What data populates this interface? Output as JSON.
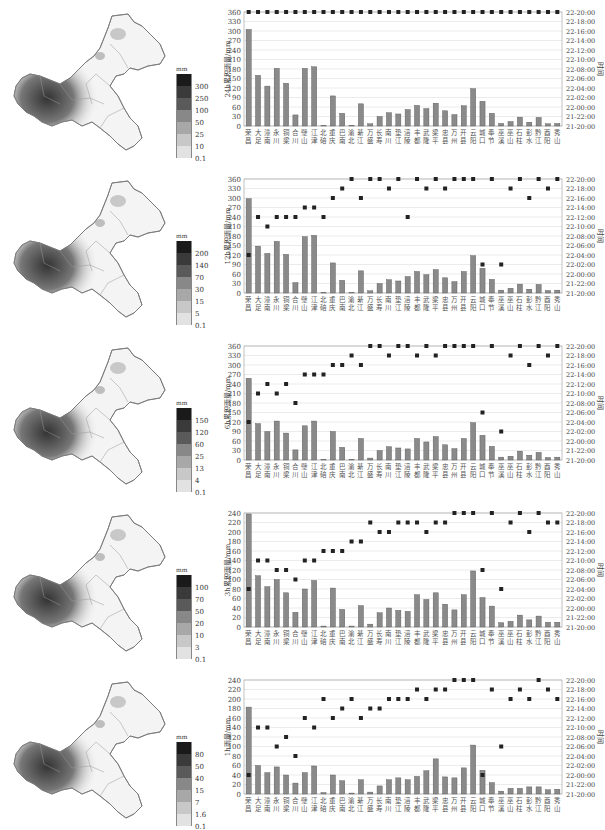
{
  "stations": [
    "荣昌",
    "大足",
    "潼南",
    "永川",
    "铜梁",
    "合川",
    "璧山",
    "江津",
    "北碚",
    "重庆",
    "巴南",
    "渝北",
    "綦江",
    "万盛",
    "长寿",
    "南川",
    "垫江",
    "涪陵",
    "丰都",
    "武隆",
    "梁平",
    "忠县",
    "万州",
    "开县",
    "云阳",
    "城口",
    "奉节",
    "巫溪",
    "巫山",
    "石柱",
    "彭水",
    "黔江",
    "酉阳",
    "秀山"
  ],
  "right_axis": {
    "label": "时间",
    "ticks": [
      "21-20:00",
      "21-22:00",
      "22-00:00",
      "22-02:00",
      "22-04:00",
      "22-06:00",
      "22-08:00",
      "22-10:00",
      "22-12:00",
      "22-14:00",
      "22-16:00",
      "22-18:00",
      "22-20:00"
    ]
  },
  "chart_data": [
    {
      "type": "bar",
      "title": "24h",
      "ylabel": "24h累积雨量/mm",
      "ylim": [
        0,
        360
      ],
      "yticks": [
        0,
        30,
        60,
        90,
        120,
        150,
        180,
        210,
        240,
        270,
        300,
        330,
        360
      ],
      "legend": {
        "unit": "mm",
        "labels": [
          "300",
          "250",
          "100",
          "50",
          "25",
          "10",
          "0.1"
        ]
      },
      "values": [
        305,
        160,
        126,
        182,
        135,
        35,
        182,
        187,
        2,
        95,
        40,
        2,
        70,
        7,
        30,
        42,
        38,
        52,
        65,
        55,
        72,
        48,
        36,
        64,
        118,
        78,
        40,
        8,
        14,
        28,
        12,
        27,
        7,
        8
      ],
      "time_index": [
        12,
        12,
        12,
        12,
        12,
        12,
        12,
        12,
        12,
        12,
        12,
        12,
        12,
        12,
        12,
        12,
        12,
        12,
        12,
        12,
        12,
        12,
        12,
        12,
        12,
        12,
        12,
        12,
        12,
        12,
        12,
        12,
        12,
        12
      ]
    },
    {
      "type": "bar",
      "title": "12h",
      "ylabel": "12h累积雨量/mm",
      "ylim": [
        0,
        360
      ],
      "yticks": [
        0,
        30,
        60,
        90,
        120,
        150,
        180,
        210,
        240,
        270,
        300,
        330,
        360
      ],
      "legend": {
        "unit": "mm",
        "labels": [
          "200",
          "140",
          "70",
          "30",
          "15",
          "5",
          "0.1"
        ]
      },
      "values": [
        298,
        148,
        125,
        163,
        122,
        33,
        178,
        182,
        2,
        95,
        40,
        2,
        70,
        7,
        30,
        42,
        38,
        52,
        68,
        58,
        74,
        48,
        36,
        68,
        118,
        78,
        43,
        9,
        15,
        28,
        12,
        27,
        8,
        9
      ],
      "time_index": [
        4,
        8,
        7,
        8,
        8,
        8,
        9,
        9,
        8,
        10,
        11,
        12,
        10,
        12,
        12,
        11,
        12,
        8,
        12,
        11,
        12,
        11,
        12,
        12,
        12,
        3,
        12,
        3,
        11,
        12,
        10,
        12,
        11,
        12
      ]
    },
    {
      "type": "bar",
      "title": "6h",
      "ylabel": "6h累积雨量/mm",
      "ylim": [
        0,
        360
      ],
      "yticks": [
        0,
        30,
        60,
        90,
        120,
        150,
        180,
        210,
        240,
        270,
        300,
        330,
        360
      ],
      "legend": {
        "unit": "mm",
        "labels": [
          "150",
          "120",
          "60",
          "25",
          "13",
          "4",
          "0.1"
        ]
      },
      "values": [
        258,
        115,
        90,
        123,
        85,
        32,
        108,
        123,
        2,
        90,
        40,
        2,
        68,
        6,
        30,
        42,
        38,
        35,
        68,
        57,
        74,
        48,
        36,
        68,
        118,
        78,
        43,
        9,
        12,
        28,
        15,
        24,
        8,
        9
      ],
      "time_index": [
        4,
        7,
        8,
        7,
        8,
        6,
        9,
        9,
        9,
        10,
        10,
        11,
        10,
        12,
        12,
        11,
        12,
        12,
        11,
        12,
        11,
        12,
        12,
        12,
        12,
        5,
        12,
        3,
        11,
        12,
        10,
        12,
        11,
        12
      ]
    },
    {
      "type": "bar",
      "title": "3h",
      "ylabel": "3h累积雨量/mm",
      "ylim": [
        0,
        240
      ],
      "yticks": [
        0,
        20,
        40,
        60,
        80,
        100,
        120,
        140,
        160,
        180,
        200,
        220,
        240
      ],
      "legend": {
        "unit": "mm",
        "labels": [
          "100",
          "70",
          "50",
          "20",
          "10",
          "3",
          "0.1"
        ]
      },
      "values": [
        238,
        108,
        85,
        100,
        72,
        31,
        80,
        98,
        2,
        82,
        37,
        2,
        45,
        6,
        30,
        40,
        35,
        33,
        68,
        58,
        72,
        48,
        36,
        68,
        118,
        62,
        44,
        9,
        12,
        25,
        15,
        23,
        10,
        10
      ],
      "time_index": [
        4,
        7,
        7,
        6,
        6,
        5,
        7,
        7,
        8,
        8,
        8,
        9,
        9,
        11,
        10,
        10,
        11,
        11,
        11,
        10,
        11,
        11,
        12,
        12,
        12,
        6,
        12,
        4,
        11,
        12,
        10,
        12,
        11,
        11
      ],
      "extra_points": [
        {
          "station": "北碚",
          "time_index": 9
        }
      ]
    },
    {
      "type": "bar",
      "title": "1h",
      "ylabel": "1h雨量/mm",
      "ylim": [
        0,
        240
      ],
      "yticks": [
        0,
        20,
        40,
        60,
        80,
        100,
        120,
        140,
        160,
        180,
        200,
        220,
        240
      ],
      "legend": {
        "unit": "mm",
        "labels": [
          "80",
          "50",
          "40",
          "15",
          "7",
          "1.6",
          "0.1"
        ]
      },
      "values": [
        183,
        60,
        45,
        57,
        40,
        23,
        45,
        59,
        3,
        40,
        28,
        2,
        30,
        4,
        17,
        30,
        34,
        30,
        37,
        49,
        74,
        36,
        34,
        55,
        103,
        50,
        24,
        6,
        12,
        12,
        15,
        15,
        9,
        10
      ],
      "time_index": [
        2,
        7,
        7,
        5,
        6,
        4,
        8,
        7,
        10,
        8,
        9,
        10,
        8,
        9,
        9,
        10,
        10,
        10,
        11,
        10,
        11,
        11,
        12,
        12,
        12,
        2,
        11,
        5,
        10,
        11,
        10,
        12,
        11,
        10
      ]
    }
  ]
}
